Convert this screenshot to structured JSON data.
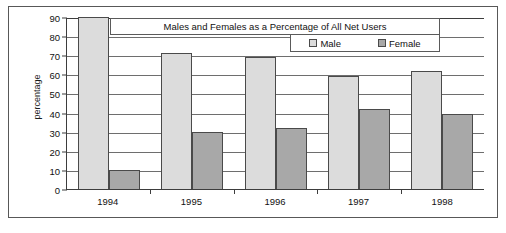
{
  "chart_data": {
    "type": "bar",
    "title": "Males and Females as a Percentage of All Net Users",
    "xlabel": "",
    "ylabel": "percentage",
    "categories": [
      "1994",
      "1995",
      "1996",
      "1997",
      "1998"
    ],
    "series": [
      {
        "name": "Male",
        "color": "#dcdcdc",
        "values": [
          90,
          71,
          69,
          59,
          62
        ]
      },
      {
        "name": "Female",
        "color": "#a8a8a8",
        "values": [
          10,
          30,
          32,
          42,
          39
        ]
      }
    ],
    "ylim": [
      0,
      90
    ],
    "yticks": [
      0,
      10,
      20,
      30,
      40,
      50,
      60,
      70,
      80,
      90
    ],
    "ytick_labels": [
      "0",
      "10",
      "20",
      "30",
      "40",
      "50",
      "60",
      "70",
      "80",
      "90"
    ],
    "grid": true,
    "legend_position": "top-right",
    "legend": [
      "Male",
      "Female"
    ]
  }
}
